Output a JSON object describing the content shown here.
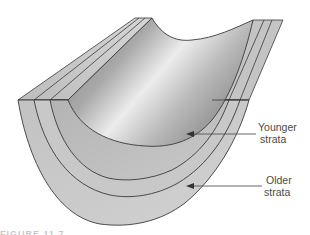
{
  "diagram": {
    "type": "syncline block diagram",
    "labels": [
      {
        "id": "younger",
        "line1": "Younger",
        "line2": "strata"
      },
      {
        "id": "older",
        "line1": "Older",
        "line2": "strata"
      }
    ],
    "caption_fragment": "FIGURE 11.7",
    "colors": {
      "stroke": "#3a3a3a",
      "layer_fill": "#c9c9c9",
      "layer_fill_dark": "#b3b3b3",
      "trough_dark": "#8e8e8e",
      "trough_light": "#e6e6e6",
      "arrow": "#555555",
      "label_text": "#4a4a4a"
    }
  }
}
